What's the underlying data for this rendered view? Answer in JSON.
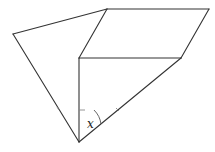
{
  "diagram": {
    "type": "geometry-figure",
    "stroke_color": "#333333",
    "vertices": {
      "left": [
        13,
        34
      ],
      "top_middle": [
        107,
        9
      ],
      "top_right": [
        209,
        9
      ],
      "mid_left": [
        79,
        58
      ],
      "mid_right": [
        181,
        58
      ],
      "bottom": [
        79,
        142
      ]
    },
    "angle_label": "x"
  }
}
